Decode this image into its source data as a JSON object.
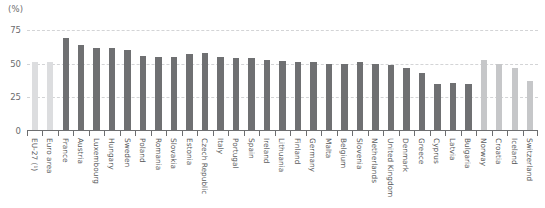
{
  "chart_data": {
    "type": "bar",
    "title": "",
    "subtitle": "",
    "unit_label": "(%)",
    "xlabel": "",
    "ylabel": "",
    "ylim": [
      0,
      75
    ],
    "yticks": [
      0,
      25,
      50,
      75
    ],
    "ytick_labels": [
      "0",
      "25",
      "50",
      "75"
    ],
    "grid": true,
    "legend": "none",
    "categories": [
      "EU-27 (¹)",
      "Euro area",
      "France",
      "Austria",
      "Luxembourg",
      "Hungary",
      "Sweden",
      "Poland",
      "Romania",
      "Slovakia",
      "Estonia",
      "Czech Republic",
      "Italy",
      "Portugal",
      "Spain",
      "Ireland",
      "Lithuania",
      "Finland",
      "Germany",
      "Malta",
      "Belgium",
      "Slovenia",
      "Netherlands",
      "United Kingdom",
      "Denmark",
      "Greece",
      "Cyprus",
      "Latvia",
      "Bulgaria",
      "Norway",
      "Croatia",
      "Iceland",
      "Switzerland"
    ],
    "values": [
      51,
      51,
      69,
      64,
      62,
      62,
      60,
      56,
      55,
      55,
      57,
      58,
      55,
      54,
      54,
      53,
      52,
      51,
      51,
      50,
      50,
      51,
      50,
      49,
      47,
      43,
      35,
      36,
      35,
      53,
      50,
      47,
      37
    ],
    "groups": [
      "aggregate",
      "aggregate",
      "member",
      "member",
      "member",
      "member",
      "member",
      "member",
      "member",
      "member",
      "member",
      "member",
      "member",
      "member",
      "member",
      "member",
      "member",
      "member",
      "member",
      "member",
      "member",
      "member",
      "member",
      "member",
      "member",
      "member",
      "member",
      "member",
      "member",
      "other",
      "other",
      "other",
      "other"
    ],
    "colors": {
      "aggregate": "#dcdddf",
      "member": "#6f7072",
      "other": "#c6c7c9",
      "axis": "#6d6e70",
      "grid": "#d3d4d6",
      "text": "#58595b"
    }
  }
}
